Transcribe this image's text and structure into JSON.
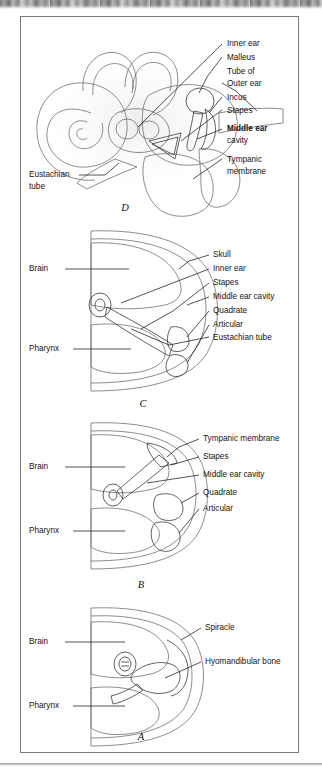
{
  "figure": {
    "domain": "anatomy-diagram",
    "title_visible": false,
    "background": "#ffffff",
    "frame_color": "#7b7b7b",
    "label_color": "#141414",
    "panel_order_top_to_bottom": [
      "D",
      "C",
      "B",
      "A"
    ],
    "scan_artifact_top": true
  },
  "panels": [
    {
      "letter": "D",
      "left_labels": [
        {
          "text": "Eustachian",
          "line2": "tube"
        }
      ],
      "right_labels": [
        {
          "text": "Inner ear",
          "bold": false
        },
        {
          "text": "Malleus",
          "bold": false
        },
        {
          "text": "Tube of",
          "bold": false
        },
        {
          "text": "Outer ear",
          "bold": false
        },
        {
          "text": "Incus",
          "bold": false
        },
        {
          "text": "Stapes",
          "bold": false
        },
        {
          "text": "Middle ear",
          "bold": true
        },
        {
          "text": "cavity",
          "bold": false
        },
        {
          "text": "Tympanic",
          "bold": false
        },
        {
          "text": "membrane",
          "bold": false
        }
      ]
    },
    {
      "letter": "C",
      "left_labels": [
        {
          "text": "Brain"
        },
        {
          "text": "Pharynx"
        }
      ],
      "right_labels": [
        {
          "text": "Skull"
        },
        {
          "text": "Inner ear"
        },
        {
          "text": "Stapes"
        },
        {
          "text": "Middle ear cavity"
        },
        {
          "text": "Quadrate"
        },
        {
          "text": "Articular"
        },
        {
          "text": "Eustachian tube"
        }
      ]
    },
    {
      "letter": "B",
      "left_labels": [
        {
          "text": "Brain"
        },
        {
          "text": "Pharynx"
        }
      ],
      "right_labels": [
        {
          "text": "Tympanic membrane"
        },
        {
          "text": "Stapes"
        },
        {
          "text": "Middle ear cavity"
        },
        {
          "text": "Quadrate"
        },
        {
          "text": "Articular"
        }
      ]
    },
    {
      "letter": "A",
      "left_labels": [
        {
          "text": "Brain"
        },
        {
          "text": "Pharynx"
        }
      ],
      "right_labels": [
        {
          "text": "Spiracle"
        },
        {
          "text": "Hyomandibular bone"
        }
      ]
    }
  ]
}
